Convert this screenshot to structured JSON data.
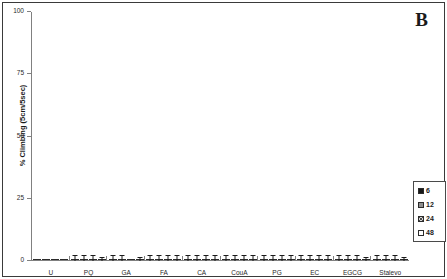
{
  "figure": {
    "panel_label": "B",
    "background_color": "#ffffff",
    "border_color": "#3a3a3a"
  },
  "chart_data": {
    "type": "bar",
    "title": "",
    "subtitle": "",
    "xlabel": "",
    "ylabel": "% Climbing (5cm/5sec)",
    "ylim": [
      0,
      100
    ],
    "yticks": [
      0,
      25,
      50,
      75,
      100
    ],
    "ytick_labels": [
      "0",
      "25",
      "50",
      "75",
      "100"
    ],
    "grid": false,
    "legend_position": "right-outside",
    "legend_title": "",
    "categories": [
      "U",
      "PQ",
      "GA",
      "FA",
      "CA",
      "CouA",
      "PG",
      "EC",
      "EGCG",
      "Stalevo"
    ],
    "series": [
      {
        "name": "6",
        "color": "#171717",
        "pattern": "solid-black",
        "values": [
          100,
          87,
          60,
          70,
          59,
          72,
          70,
          57,
          40,
          62
        ],
        "errors": [
          0,
          0.8,
          0.8,
          0.8,
          0.8,
          0.8,
          0.8,
          0.8,
          0.8,
          0.8
        ]
      },
      {
        "name": "12",
        "color": "#8e8e8e",
        "pattern": "solid-gray",
        "values": [
          100,
          43,
          65,
          85,
          64,
          73,
          75,
          72,
          30,
          69
        ],
        "errors": [
          0,
          0.8,
          0.8,
          0.8,
          0.8,
          0.8,
          0.8,
          0.8,
          0.8,
          0.8
        ]
      },
      {
        "name": "24",
        "color": "#d8d8d8",
        "pattern": "crosshatch",
        "values": [
          100,
          17,
          100,
          57,
          95,
          56,
          71,
          82,
          25,
          77
        ],
        "errors": [
          0,
          0.8,
          0,
          0.8,
          0.8,
          0.8,
          0.8,
          0.8,
          0.8,
          0.8
        ]
      },
      {
        "name": "48",
        "color": "#ffffff",
        "pattern": "open-white",
        "values": [
          100,
          12,
          57,
          67,
          61,
          84,
          71,
          52,
          15,
          57
        ],
        "errors": [
          0,
          0.5,
          0.5,
          0.8,
          0.8,
          0.8,
          0.8,
          0.8,
          0.5,
          0.5
        ]
      }
    ]
  },
  "legend": {
    "entries": [
      {
        "label": "6",
        "swatch": "solid-black"
      },
      {
        "label": "12",
        "swatch": "solid-gray"
      },
      {
        "label": "24",
        "swatch": "crosshatch"
      },
      {
        "label": "48",
        "swatch": "open-white"
      }
    ]
  }
}
